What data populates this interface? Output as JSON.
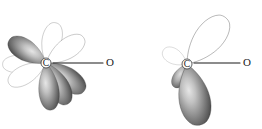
{
  "figure": {
    "background_color": "#ffffff",
    "width": 262,
    "height": 129
  },
  "colors": {
    "outline_stroke": "#4a4a4a",
    "shaded_stroke": "#3a3a3a",
    "lobe_dark": "#4d4d4d",
    "lobe_mid": "#8c8c8c",
    "lobe_light": "#d8d8d8",
    "lobe_white": "#ffffff",
    "bond_line": "#1a1a1a",
    "label_text": "#1a1a1a"
  },
  "diagrams": [
    {
      "id": "left-diagram",
      "name": "left-orbital-diagram",
      "center_label": "C",
      "terminal_label": "O",
      "center": {
        "x": 46,
        "y": 63
      },
      "terminal": {
        "x": 110,
        "y": 63
      },
      "bond": {
        "x1": 53,
        "y1": 63,
        "x2": 103,
        "y2": 63
      },
      "lobe_count": 8,
      "lobes": [
        {
          "name": "lobe-up-left-shaded",
          "style": "shaded",
          "angle": -148,
          "length": 42,
          "width": 25
        },
        {
          "name": "lobe-up-center-outline",
          "style": "outline",
          "angle": -104,
          "length": 40,
          "width": 23
        },
        {
          "name": "lobe-up-right-outline",
          "style": "outline",
          "angle": -62,
          "length": 44,
          "width": 24
        },
        {
          "name": "lobe-left-outline",
          "style": "outline",
          "angle": 178,
          "length": 42,
          "width": 21
        },
        {
          "name": "lobe-down-left-outline",
          "style": "outline",
          "angle": 152,
          "length": 41,
          "width": 22
        },
        {
          "name": "lobe-down-center-shaded",
          "style": "shaded",
          "angle": 84,
          "length": 46,
          "width": 24
        },
        {
          "name": "lobe-down-mid-shaded",
          "style": "shaded",
          "angle": 62,
          "length": 45,
          "width": 25
        },
        {
          "name": "lobe-down-right-shaded",
          "style": "shaded",
          "angle": 36,
          "length": 46,
          "width": 26
        }
      ]
    },
    {
      "id": "right-diagram",
      "name": "right-orbital-diagram",
      "center_label": "C",
      "terminal_label": "O",
      "center": {
        "x": 187,
        "y": 64
      },
      "terminal": {
        "x": 247,
        "y": 63
      },
      "bond": {
        "x1": 194,
        "y1": 63,
        "x2": 240,
        "y2": 63
      },
      "lobe_count": 4,
      "lobes": [
        {
          "name": "lobe-up-right-large-outline",
          "style": "outline",
          "angle": -68,
          "length": 58,
          "width": 34
        },
        {
          "name": "lobe-up-left-small-outline",
          "style": "outline",
          "angle": -152,
          "length": 25,
          "width": 17
        },
        {
          "name": "lobe-down-left-small-shaded",
          "style": "shaded",
          "angle": 118,
          "length": 24,
          "width": 15
        },
        {
          "name": "lobe-down-right-large-shaded",
          "style": "shaded",
          "angle": 68,
          "length": 60,
          "width": 37
        }
      ]
    }
  ]
}
